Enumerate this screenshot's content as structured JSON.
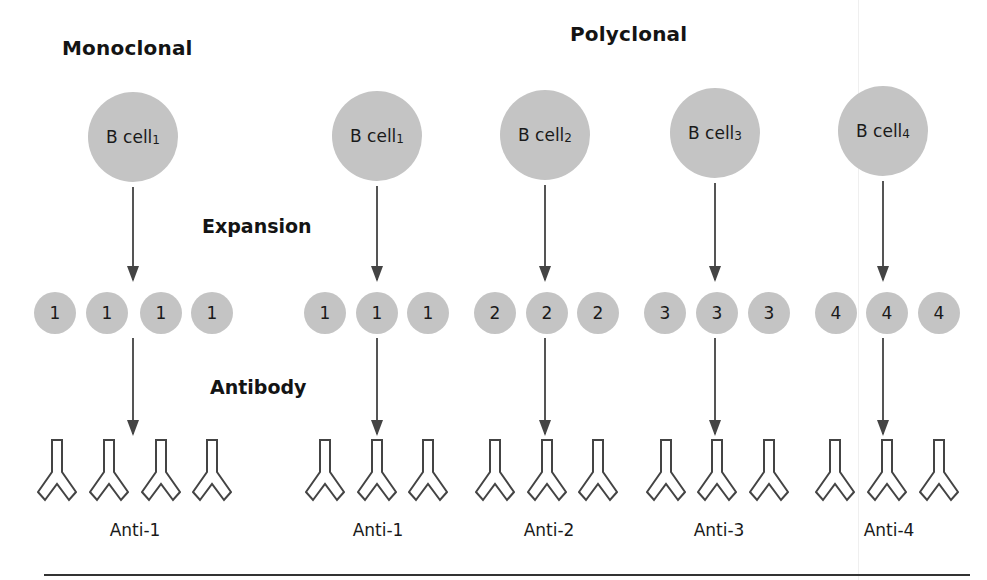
{
  "titles": {
    "monoclonal": "Monoclonal",
    "polyclonal": "Polyclonal"
  },
  "steps": {
    "expansion": "Expansion",
    "antibody": "Antibody"
  },
  "colors": {
    "cell_fill": "#c4c4c4",
    "arrow": "#555555",
    "outline": "#444444",
    "text": "#1a1a1a"
  },
  "groups": [
    {
      "panel": "monoclonal",
      "b_cell": {
        "label": "B cell",
        "subscript": "1",
        "cx": 133,
        "cy": 137
      },
      "clones": [
        {
          "label": "1",
          "cx": 55
        },
        {
          "label": "1",
          "cx": 107
        },
        {
          "label": "1",
          "cx": 161
        },
        {
          "label": "1",
          "cx": 212
        }
      ],
      "antibodies": [
        57,
        109,
        161,
        212
      ],
      "antibody_label": "Anti-1",
      "label_cx": 135
    },
    {
      "panel": "polyclonal",
      "b_cell": {
        "label": "B cell",
        "subscript": "1",
        "cx": 377,
        "cy": 136
      },
      "clones": [
        {
          "label": "1",
          "cx": 325
        },
        {
          "label": "1",
          "cx": 377
        },
        {
          "label": "1",
          "cx": 428
        }
      ],
      "antibodies": [
        325,
        377,
        428
      ],
      "antibody_label": "Anti-1",
      "label_cx": 378
    },
    {
      "panel": "polyclonal",
      "b_cell": {
        "label": "B cell",
        "subscript": "2",
        "cx": 545,
        "cy": 135
      },
      "clones": [
        {
          "label": "2",
          "cx": 495
        },
        {
          "label": "2",
          "cx": 547
        },
        {
          "label": "2",
          "cx": 598
        }
      ],
      "antibodies": [
        495,
        547,
        598
      ],
      "antibody_label": "Anti-2",
      "label_cx": 549
    },
    {
      "panel": "polyclonal",
      "b_cell": {
        "label": "B cell",
        "subscript": "3",
        "cx": 715,
        "cy": 133
      },
      "clones": [
        {
          "label": "3",
          "cx": 665
        },
        {
          "label": "3",
          "cx": 717
        },
        {
          "label": "3",
          "cx": 769
        }
      ],
      "antibodies": [
        666,
        717,
        769
      ],
      "antibody_label": "Anti-3",
      "label_cx": 719
    },
    {
      "panel": "polyclonal",
      "b_cell": {
        "label": "B cell",
        "subscript": "4",
        "cx": 883,
        "cy": 131
      },
      "clones": [
        {
          "label": "4",
          "cx": 836
        },
        {
          "label": "4",
          "cx": 887
        },
        {
          "label": "4",
          "cx": 939
        }
      ],
      "antibodies": [
        835,
        887,
        939
      ],
      "antibody_label": "Anti-4",
      "label_cx": 889
    }
  ]
}
